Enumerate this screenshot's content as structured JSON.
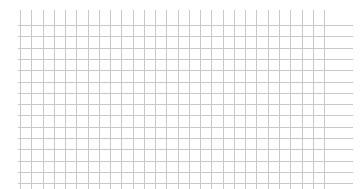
{
  "chart_data": {
    "type": "line",
    "title": "",
    "xlabel": "",
    "ylabel": "",
    "series": [],
    "grid": true,
    "legend": null,
    "layout": {
      "vertical_lines": {
        "count": 28,
        "x_start": 20,
        "spacing": 11.26,
        "y_top": 10,
        "y_bottom": 189
      },
      "horizontal_lines": {
        "count": 15,
        "y_start": 25,
        "spacing": 11.3,
        "x_left": 18,
        "x_right": 353
      }
    },
    "colors": {
      "background": "#ffffff",
      "grid_line": "#c9c9c9"
    }
  }
}
